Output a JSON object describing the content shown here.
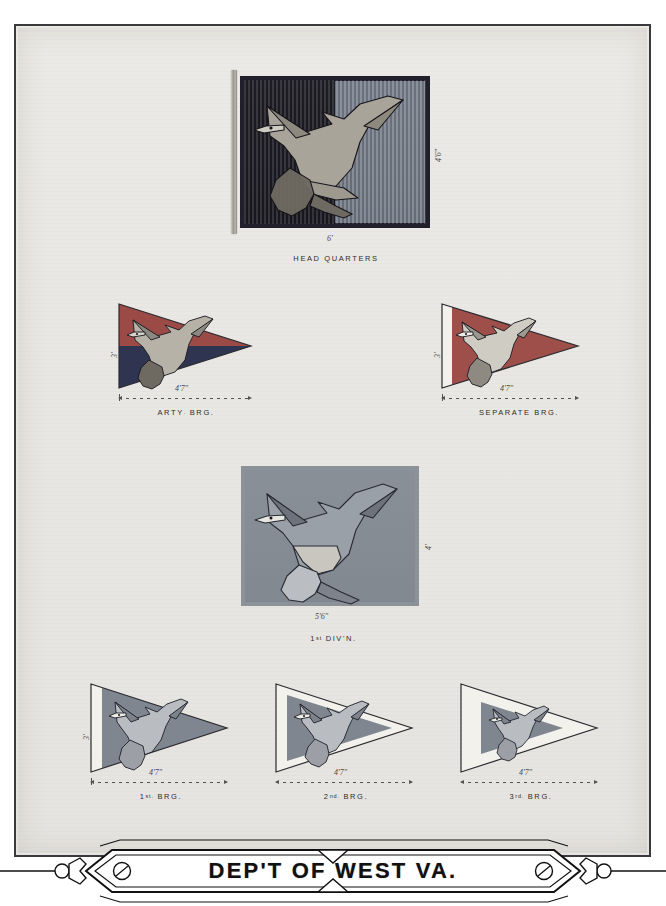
{
  "plate": {
    "title": "DEP'T OF WEST VA.",
    "background_color": "#e9e7e3",
    "frame_color": "#3a3a3c"
  },
  "figures": [
    {
      "id": "head-quarters",
      "caption": "HEAD QUARTERS",
      "type": "rectangular-flag",
      "width_label": "6'",
      "height_label": "4'6\"",
      "colors": {
        "hoist_half": "#1f1e26",
        "fly_half": "#7a818d",
        "border": "#211f2a"
      },
      "device": "eagle"
    },
    {
      "id": "arty-brg",
      "caption": "ARTY. BRG.",
      "caption_main": "ARTY",
      "caption_suffix": ".",
      "caption_tail": "BRG.",
      "type": "guidon",
      "hoist_label": "3'",
      "fly_label": "4'7\"",
      "colors": {
        "upper": "#9b4a46",
        "lower": "#2f3550",
        "hoist_stripe": "none"
      },
      "device": "eagle"
    },
    {
      "id": "separate-brg",
      "caption": "SEPARATE BRG.",
      "type": "guidon",
      "hoist_label": "3'",
      "fly_label": "4'7\"",
      "colors": {
        "upper": "#9e4f4a",
        "lower": "#9e4f4a",
        "hoist_stripe": "#f2f1ec"
      },
      "device": "eagle"
    },
    {
      "id": "first-division",
      "caption": "1st DIV'N.",
      "caption_main": "1",
      "caption_suffix": "st",
      "caption_tail": "DIV'N.",
      "type": "rectangular-flag",
      "width_label": "5'6\"",
      "height_label": "4'",
      "colors": {
        "field": "#868d95",
        "border": "#8d9299"
      },
      "device": "eagle"
    },
    {
      "id": "first-brg",
      "caption": "1st. BRG.",
      "caption_main": "1",
      "caption_suffix": "st.",
      "caption_tail": "BRG.",
      "type": "guidon",
      "hoist_label": "3'",
      "fly_label": "4'7\"",
      "colors": {
        "field": "#7f868f",
        "hoist_stripe": "#f2f1ec"
      },
      "device": "eagle"
    },
    {
      "id": "second-brg",
      "caption": "2nd. BRG.",
      "caption_main": "2",
      "caption_suffix": "nd.",
      "caption_tail": "BRG.",
      "type": "guidon",
      "fly_label": "4'7\"",
      "colors": {
        "field": "#7f868f",
        "border": "#f2f1ec"
      },
      "device": "eagle"
    },
    {
      "id": "third-brg",
      "caption": "3rd. BRG.",
      "caption_main": "3",
      "caption_suffix": "rd.",
      "caption_tail": "BRG.",
      "type": "guidon",
      "fly_label": "4'7\"",
      "colors": {
        "field": "#7f868f",
        "border": "#f2f1ec"
      },
      "device": "eagle"
    }
  ]
}
